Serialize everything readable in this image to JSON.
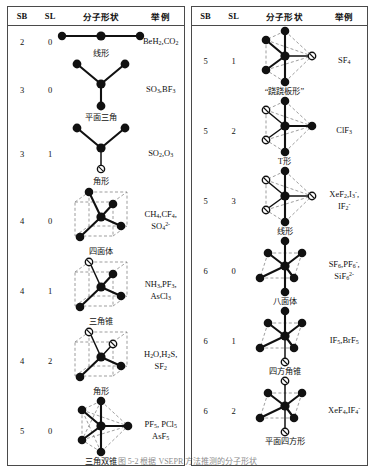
{
  "document": {
    "title": "VSEPR 分子形状表",
    "caption": "图 5-2 根据 VSEPR 方法推测的分子形状"
  },
  "columns": {
    "sb": "SB",
    "sl": "SL",
    "shape": "分子形状",
    "examples": "举例"
  },
  "left_panel": {
    "rows": [
      {
        "sb": "2",
        "sl": "0",
        "geometry": "linear",
        "shape_label": "线形",
        "examples": "BeH₂, CO₂",
        "examples_parts": [
          "BeH",
          "2",
          ", CO",
          "2"
        ]
      },
      {
        "sb": "3",
        "sl": "0",
        "geometry": "trigonal-planar",
        "shape_label": "平面三角",
        "examples": "SO₃, BF₃"
      },
      {
        "sb": "3",
        "sl": "1",
        "geometry": "bent-3",
        "shape_label": "角形",
        "examples": "SO₂, O₃"
      },
      {
        "sb": "4",
        "sl": "0",
        "geometry": "tetrahedral",
        "shape_label": "四面体",
        "examples": "CH₄, CF₄, SO₄²⁻"
      },
      {
        "sb": "4",
        "sl": "1",
        "geometry": "trigonal-pyramidal",
        "shape_label": "三角锥",
        "examples": "NH₃, PF₃, AsCl₃"
      },
      {
        "sb": "4",
        "sl": "2",
        "geometry": "bent-4",
        "shape_label": "角形",
        "examples": "H₂O, H₂S, SF₂"
      },
      {
        "sb": "5",
        "sl": "0",
        "geometry": "trigonal-bipyramidal",
        "shape_label": "三角双锥",
        "examples": "PF₅, PCl₅, AsF₅"
      }
    ]
  },
  "right_panel": {
    "rows": [
      {
        "sb": "5",
        "sl": "1",
        "geometry": "seesaw",
        "shape_label": "“跷跷板形”",
        "examples": "SF₄"
      },
      {
        "sb": "5",
        "sl": "2",
        "geometry": "t-shaped",
        "shape_label": "T形",
        "examples": "ClF₃"
      },
      {
        "sb": "5",
        "sl": "3",
        "geometry": "linear-5",
        "shape_label": "线形",
        "examples": "XeF₂, I₃⁻, IF₂⁻"
      },
      {
        "sb": "6",
        "sl": "0",
        "geometry": "octahedral",
        "shape_label": "八面体",
        "examples": "SF₆, PF₆⁻, SiF₆²⁻"
      },
      {
        "sb": "6",
        "sl": "1",
        "geometry": "square-pyramidal",
        "shape_label": "四方角锥",
        "examples": "IF₅, BrF₅"
      },
      {
        "sb": "6",
        "sl": "2",
        "geometry": "square-planar",
        "shape_label": "平面四方形",
        "examples": "XeF₄, IF₄⁻"
      }
    ]
  },
  "colors": {
    "border": "#4a4a4a",
    "atom": "#111111",
    "dashed_edge": "#8d8d8d",
    "background": "#ffffff"
  }
}
